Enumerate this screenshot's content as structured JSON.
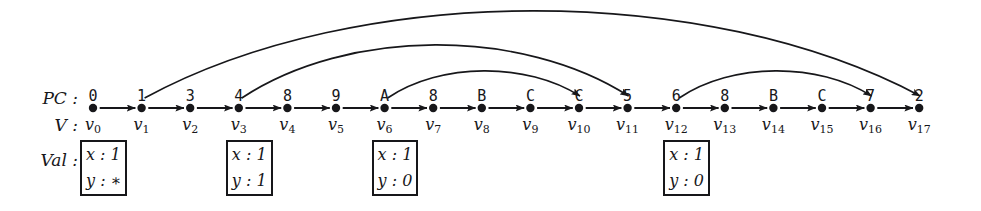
{
  "figure": {
    "type": "trace-graph",
    "background_color": "#ffffff",
    "ink_color": "#17171a",
    "row_labels": {
      "pc": "PC :",
      "v": "V :",
      "val": "Val :"
    },
    "node_count": 18,
    "first_node_x": 93,
    "node_spacing": 48.6,
    "node_y": 108,
    "node_radius": 4.2
  },
  "nodes": [
    {
      "index": 0,
      "pc": "0",
      "name": "v",
      "sub": "0"
    },
    {
      "index": 1,
      "pc": "1",
      "name": "v",
      "sub": "1"
    },
    {
      "index": 2,
      "pc": "3",
      "name": "v",
      "sub": "2"
    },
    {
      "index": 3,
      "pc": "4",
      "name": "v",
      "sub": "3"
    },
    {
      "index": 4,
      "pc": "8",
      "name": "v",
      "sub": "4"
    },
    {
      "index": 5,
      "pc": "9",
      "name": "v",
      "sub": "5"
    },
    {
      "index": 6,
      "pc": "A",
      "name": "v",
      "sub": "6"
    },
    {
      "index": 7,
      "pc": "8",
      "name": "v",
      "sub": "7"
    },
    {
      "index": 8,
      "pc": "B",
      "name": "v",
      "sub": "8"
    },
    {
      "index": 9,
      "pc": "C",
      "name": "v",
      "sub": "9"
    },
    {
      "index": 10,
      "pc": "C",
      "name": "v",
      "sub": "10"
    },
    {
      "index": 11,
      "pc": "5",
      "name": "v",
      "sub": "11"
    },
    {
      "index": 12,
      "pc": "6",
      "name": "v",
      "sub": "12"
    },
    {
      "index": 13,
      "pc": "8",
      "name": "v",
      "sub": "13"
    },
    {
      "index": 14,
      "pc": "B",
      "name": "v",
      "sub": "14"
    },
    {
      "index": 15,
      "pc": "C",
      "name": "v",
      "sub": "15"
    },
    {
      "index": 16,
      "pc": "7",
      "name": "v",
      "sub": "16"
    },
    {
      "index": 17,
      "pc": "2",
      "name": "v",
      "sub": "17"
    }
  ],
  "val_boxes": [
    {
      "at_node": 0,
      "lines": [
        "x : 1",
        "y : ∗"
      ]
    },
    {
      "at_node": 3,
      "lines": [
        "x : 1",
        "y : 1"
      ]
    },
    {
      "at_node": 6,
      "lines": [
        "x : 1",
        "y : 0"
      ]
    },
    {
      "at_node": 12,
      "lines": [
        "x : 1",
        "y : 0"
      ]
    }
  ],
  "sequential_edges": [
    {
      "from": 0,
      "to": 1
    },
    {
      "from": 1,
      "to": 2
    },
    {
      "from": 2,
      "to": 3
    },
    {
      "from": 3,
      "to": 4
    },
    {
      "from": 4,
      "to": 5
    },
    {
      "from": 5,
      "to": 6
    },
    {
      "from": 6,
      "to": 7
    },
    {
      "from": 7,
      "to": 8
    },
    {
      "from": 8,
      "to": 9
    },
    {
      "from": 9,
      "to": 10
    },
    {
      "from": 10,
      "to": 11
    },
    {
      "from": 11,
      "to": 12
    },
    {
      "from": 12,
      "to": 13
    },
    {
      "from": 13,
      "to": 14
    },
    {
      "from": 14,
      "to": 15
    },
    {
      "from": 15,
      "to": 16
    },
    {
      "from": 16,
      "to": 17
    }
  ],
  "arc_edges": [
    {
      "from": 1,
      "to": 17,
      "apex_y": 14
    },
    {
      "from": 3,
      "to": 11,
      "apex_y": 47
    },
    {
      "from": 6,
      "to": 10,
      "apex_y": 72
    },
    {
      "from": 12,
      "to": 16,
      "apex_y": 72
    }
  ]
}
